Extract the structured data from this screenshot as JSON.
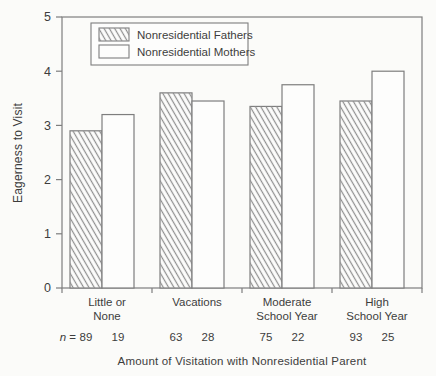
{
  "figure": {
    "colors": {
      "background": "#fbfbf9",
      "frame": "#7e7e7e",
      "text": "#3d3d3d",
      "hatch": "#8f8f8f",
      "bar_fill": "#fdfdfc"
    }
  },
  "chart_data": {
    "type": "bar",
    "title": "",
    "xlabel": "Amount of Visitation with Nonresidential Parent",
    "ylabel": "Eagerness to Visit",
    "ylim": [
      0,
      5
    ],
    "yticks": [
      0,
      1,
      2,
      3,
      4,
      5
    ],
    "grid": false,
    "legend_position": "top-left-inside",
    "categories": [
      [
        "Little or",
        "None"
      ],
      [
        "Vacations"
      ],
      [
        "Moderate",
        "School Year"
      ],
      [
        "High",
        "School Year"
      ]
    ],
    "n_label": "n =",
    "series": [
      {
        "name": "Nonresidential Fathers",
        "style": "hatched",
        "values": [
          2.9,
          3.6,
          3.35,
          3.45
        ],
        "n": [
          "89",
          "63",
          "75",
          "93"
        ]
      },
      {
        "name": "Nonresidential Mothers",
        "style": "open",
        "values": [
          3.2,
          3.45,
          3.75,
          4.0
        ],
        "n": [
          "19",
          "28",
          "22",
          "25"
        ]
      }
    ]
  }
}
